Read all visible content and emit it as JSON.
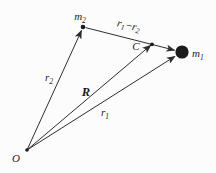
{
  "figure": {
    "colors": {
      "background": "#fcfcfc",
      "ink": "#2e2e2e",
      "point_fill": "#1c1c1c"
    },
    "points": {
      "origin": {
        "label": "O"
      },
      "mass2": {
        "label_base": "m",
        "label_sub": "2"
      },
      "mass1": {
        "label_base": "m",
        "label_sub": "1"
      },
      "center_of_mass": {
        "label": "C"
      }
    },
    "vectors": {
      "r2": {
        "label_base": "r",
        "label_sub": "2"
      },
      "r1": {
        "label_base": "r",
        "label_sub": "1"
      },
      "R": {
        "label": "R"
      },
      "r1_minus_r2": {
        "base1": "r",
        "sub1": "1",
        "minus": "−",
        "base2": "r",
        "sub2": "2"
      }
    }
  }
}
